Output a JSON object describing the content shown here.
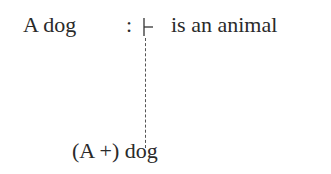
{
  "diagram": {
    "top_row": {
      "subject": "A dog",
      "colon": ":",
      "turnstile_icon": "turnstile",
      "predicate": "is an animal"
    },
    "connector": "dashed-vertical-line",
    "bottom": {
      "label": "(A +) dog"
    }
  }
}
